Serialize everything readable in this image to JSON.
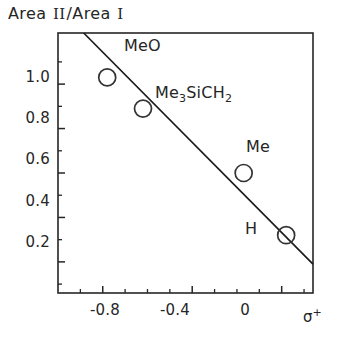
{
  "chart_data": {
    "type": "scatter",
    "title": "Area II/Area I",
    "title_parts": {
      "prefix": "Area ",
      "numeral_two": "II",
      "separator": "/Area ",
      "numeral_one": "I"
    },
    "xlabel": "σ",
    "xlabel_superscript": "+",
    "ylabel": "Area II/Area I",
    "xlim": [
      -1.0,
      0.14
    ],
    "ylim": [
      0.06,
      1.23
    ],
    "grid": false,
    "legend": null,
    "x_ticks": [
      "-0.8",
      "-0.4",
      "0"
    ],
    "x_tick_values": [
      -0.8,
      -0.4,
      0
    ],
    "x_minor_tick_values": [
      -0.9,
      -0.7,
      -0.6,
      -0.5,
      -0.3,
      -0.2,
      -0.1,
      0.1
    ],
    "y_ticks": [
      "1.0",
      "0.8",
      "0.6",
      "0.4",
      "0.2"
    ],
    "y_tick_values": [
      1.0,
      0.8,
      0.6,
      0.4,
      0.2
    ],
    "y_minor_tick_values": [
      1.1,
      0.9,
      0.7,
      0.5,
      0.3,
      0.1
    ],
    "points": [
      {
        "label": "MeO",
        "x": -0.78,
        "y": 1.03
      },
      {
        "label": "Me3SiCH2",
        "label_main": "Me",
        "label_sub1": "3",
        "label_mid": "SiCH",
        "label_sub2": "2",
        "x": -0.62,
        "y": 0.89
      },
      {
        "label": "Me",
        "x": -0.17,
        "y": 0.6
      },
      {
        "label": "H",
        "x": 0.02,
        "y": 0.32
      }
    ],
    "fit_line": {
      "x_start": -0.885,
      "y_start": 1.23,
      "x_end": 0.14,
      "y_end": 0.19,
      "slope": -1.015,
      "intercept": 0.335
    },
    "marker_style": "open-circle",
    "colors": {
      "axis": "#262626",
      "line": "#1a1a1a",
      "marker_stroke": "#333333",
      "marker_fill": "none",
      "text": "#262626",
      "background": "#ffffff"
    }
  },
  "point_labels": {
    "meo": "MeO",
    "me3sich2_main": "Me",
    "me3sich2_sub1": "3",
    "me3sich2_mid": "SiCH",
    "me3sich2_sub2": "2",
    "me": "Me",
    "h": "H"
  },
  "axis_title": {
    "prefix": "Area ",
    "numeral_two": "II",
    "separator": "/Area ",
    "numeral_one": "I"
  },
  "x_axis": {
    "ticks": [
      "-0.8",
      "-0.4",
      "0"
    ],
    "symbol": "σ",
    "superscript": "+"
  },
  "y_axis": {
    "ticks": [
      "1.0",
      "0.8",
      "0.6",
      "0.4",
      "0.2"
    ]
  }
}
